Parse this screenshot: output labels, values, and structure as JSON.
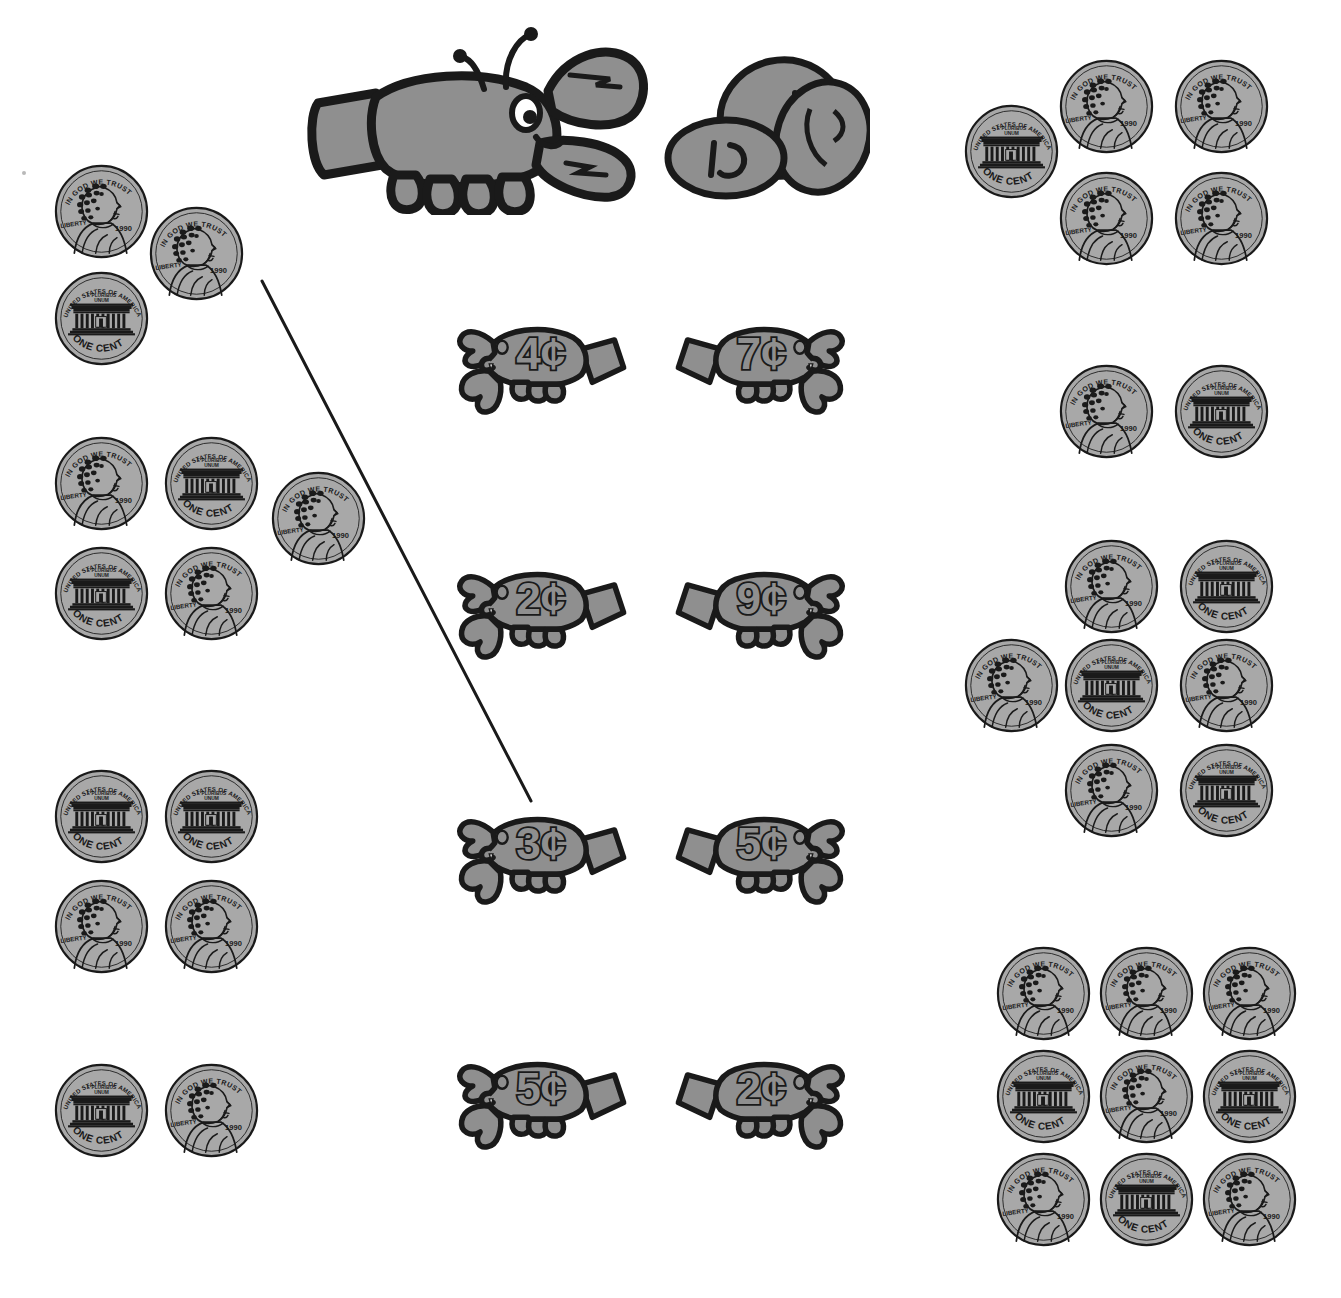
{
  "worksheet": {
    "title": "Counting Pennies Matching Worksheet",
    "background_color": "#ffffff",
    "coin_fill": "#a8a8a8",
    "coin_outline": "#1a1a1a",
    "lobster_fill": "#8f8f8f",
    "lobster_outline": "#1a1a1a",
    "line_color": "#1a1a1a"
  },
  "coin_text": {
    "heads_top": "IN GOD WE TRUST",
    "heads_left": "LIBERTY",
    "heads_date": "1990",
    "tails_top": "UNITED STATES OF AMERICA",
    "tails_motto_line1": "E PLURIBUS",
    "tails_motto_line2": "UNUM",
    "tails_bottom": "ONE CENT"
  },
  "header_illustration": {
    "name": "lobster-with-coins",
    "coin_labels": [
      "1¢",
      "1¢",
      ""
    ],
    "x": 290,
    "y": 25,
    "width": 580,
    "height": 190
  },
  "center_lobsters": [
    {
      "label": "4¢",
      "facing": "right",
      "x": 452,
      "y": 305,
      "width": 185,
      "height": 115
    },
    {
      "label": "7¢",
      "facing": "left",
      "x": 665,
      "y": 305,
      "width": 185,
      "height": 115
    },
    {
      "label": "2¢",
      "facing": "right",
      "x": 452,
      "y": 550,
      "width": 185,
      "height": 115
    },
    {
      "label": "9¢",
      "facing": "left",
      "x": 665,
      "y": 550,
      "width": 185,
      "height": 115
    },
    {
      "label": "3¢",
      "facing": "right",
      "x": 452,
      "y": 795,
      "width": 185,
      "height": 115
    },
    {
      "label": "5¢",
      "facing": "left",
      "x": 665,
      "y": 795,
      "width": 185,
      "height": 115
    },
    {
      "label": "5¢",
      "facing": "right",
      "x": 452,
      "y": 1040,
      "width": 185,
      "height": 115
    },
    {
      "label": "2¢",
      "facing": "left",
      "x": 665,
      "y": 1040,
      "width": 185,
      "height": 115
    }
  ],
  "coin_groups": [
    {
      "name": "coin-group-left-1",
      "side": "left",
      "count": 3,
      "coins": [
        {
          "face": "heads",
          "x": 53,
          "y": 163,
          "size": 97
        },
        {
          "face": "heads",
          "x": 148,
          "y": 205,
          "size": 97
        },
        {
          "face": "tails",
          "x": 53,
          "y": 270,
          "size": 97
        }
      ]
    },
    {
      "name": "coin-group-left-2",
      "side": "left",
      "count": 5,
      "coins": [
        {
          "face": "heads",
          "x": 53,
          "y": 435,
          "size": 97
        },
        {
          "face": "tails",
          "x": 163,
          "y": 435,
          "size": 97
        },
        {
          "face": "heads",
          "x": 270,
          "y": 470,
          "size": 97
        },
        {
          "face": "tails",
          "x": 53,
          "y": 545,
          "size": 97
        },
        {
          "face": "heads",
          "x": 163,
          "y": 545,
          "size": 97
        }
      ]
    },
    {
      "name": "coin-group-left-3",
      "side": "left",
      "count": 4,
      "coins": [
        {
          "face": "tails",
          "x": 53,
          "y": 768,
          "size": 97
        },
        {
          "face": "tails",
          "x": 163,
          "y": 768,
          "size": 97
        },
        {
          "face": "heads",
          "x": 53,
          "y": 878,
          "size": 97
        },
        {
          "face": "heads",
          "x": 163,
          "y": 878,
          "size": 97
        }
      ]
    },
    {
      "name": "coin-group-left-4",
      "side": "left",
      "count": 2,
      "coins": [
        {
          "face": "tails",
          "x": 53,
          "y": 1062,
          "size": 97
        },
        {
          "face": "heads",
          "x": 163,
          "y": 1062,
          "size": 97
        }
      ]
    },
    {
      "name": "coin-group-right-1",
      "side": "right",
      "count": 5,
      "coins": [
        {
          "face": "tails",
          "x": 963,
          "y": 103,
          "size": 97
        },
        {
          "face": "heads",
          "x": 1058,
          "y": 58,
          "size": 97
        },
        {
          "face": "heads",
          "x": 1173,
          "y": 58,
          "size": 97
        },
        {
          "face": "heads",
          "x": 1058,
          "y": 170,
          "size": 97
        },
        {
          "face": "heads",
          "x": 1173,
          "y": 170,
          "size": 97
        }
      ]
    },
    {
      "name": "coin-group-right-2",
      "side": "right",
      "count": 2,
      "coins": [
        {
          "face": "heads",
          "x": 1058,
          "y": 363,
          "size": 97
        },
        {
          "face": "tails",
          "x": 1173,
          "y": 363,
          "size": 97
        }
      ]
    },
    {
      "name": "coin-group-right-3",
      "side": "right",
      "count": 7,
      "coins": [
        {
          "face": "heads",
          "x": 1063,
          "y": 538,
          "size": 97
        },
        {
          "face": "tails",
          "x": 1178,
          "y": 538,
          "size": 97
        },
        {
          "face": "heads",
          "x": 963,
          "y": 637,
          "size": 97
        },
        {
          "face": "tails",
          "x": 1063,
          "y": 637,
          "size": 97
        },
        {
          "face": "heads",
          "x": 1178,
          "y": 637,
          "size": 97
        },
        {
          "face": "heads",
          "x": 1063,
          "y": 742,
          "size": 97
        },
        {
          "face": "tails",
          "x": 1178,
          "y": 742,
          "size": 97
        }
      ]
    },
    {
      "name": "coin-group-right-4",
      "side": "right",
      "count": 9,
      "coins": [
        {
          "face": "heads",
          "x": 995,
          "y": 945,
          "size": 97
        },
        {
          "face": "heads",
          "x": 1098,
          "y": 945,
          "size": 97
        },
        {
          "face": "heads",
          "x": 1201,
          "y": 945,
          "size": 97
        },
        {
          "face": "tails",
          "x": 995,
          "y": 1048,
          "size": 97
        },
        {
          "face": "heads",
          "x": 1098,
          "y": 1048,
          "size": 97
        },
        {
          "face": "tails",
          "x": 1201,
          "y": 1048,
          "size": 97
        },
        {
          "face": "heads",
          "x": 995,
          "y": 1151,
          "size": 97
        },
        {
          "face": "tails",
          "x": 1098,
          "y": 1151,
          "size": 97
        },
        {
          "face": "heads",
          "x": 1201,
          "y": 1151,
          "size": 97
        }
      ]
    }
  ],
  "connector_lines": [
    {
      "name": "match-line-3cents",
      "x1": 262,
      "y1": 281,
      "x2": 531,
      "y2": 801,
      "width": 3
    }
  ],
  "stray_marks": [
    {
      "name": "stray-dot",
      "x": 22,
      "y": 171,
      "size": 4
    }
  ]
}
